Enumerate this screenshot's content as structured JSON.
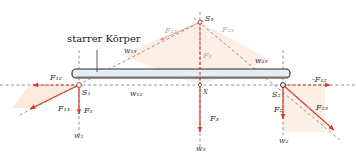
{
  "diagram": {
    "title_label": "starrer Körper",
    "points": {
      "S1": "S₁",
      "S2": "S₂",
      "S3": "S₃",
      "X": "X"
    },
    "forces": {
      "F1": "F₁",
      "F2": "F₂",
      "F3": "F₃",
      "F3_faint": "F₃",
      "F12": "F₁₂",
      "F12_neg": "-F₁₂",
      "F13": "F₁₃",
      "F13_faint": "F₁₃",
      "F23": "F₂₃",
      "F23_faint": "F₂₃"
    },
    "lines": {
      "w1": "w₁",
      "w2": "w₂",
      "w3": "w₃",
      "w12": "w₁₂",
      "w13": "w₁₃",
      "w23": "w₂₃"
    },
    "colors": {
      "force": "#e03a2a",
      "fill": "#fbe9dc",
      "rod_fill": "#e6ecef",
      "rod_stroke": "#2a2a2a",
      "dash": "#666666"
    }
  }
}
